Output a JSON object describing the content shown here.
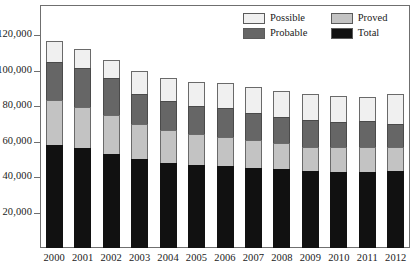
{
  "chart_data": {
    "type": "bar",
    "subtype": "stacked-column",
    "title": "",
    "xlabel": "",
    "ylabel": "",
    "categories": [
      "2000",
      "2001",
      "2002",
      "2003",
      "2004",
      "2005",
      "2006",
      "2007",
      "2008",
      "2009",
      "2010",
      "2011",
      "2012"
    ],
    "series": [
      {
        "name": "Total",
        "color": "#111111",
        "values": [
          58000,
          56300,
          53000,
          50200,
          48000,
          47000,
          46300,
          45200,
          44300,
          43300,
          42700,
          42700,
          43400
        ]
      },
      {
        "name": "Proved",
        "color": "#c3c3c3",
        "values": [
          25500,
          23100,
          22000,
          19900,
          18700,
          17300,
          16400,
          15600,
          14800,
          13900,
          14000,
          14100,
          13600
        ]
      },
      {
        "name": "Probable",
        "color": "#666666",
        "values": [
          21500,
          22100,
          21000,
          17000,
          16200,
          16000,
          16100,
          15200,
          15000,
          15000,
          14400,
          14700,
          12700
        ]
      },
      {
        "name": "Possible",
        "color": "#f0f0f0",
        "values": [
          11500,
          10900,
          9800,
          12700,
          13000,
          13500,
          14100,
          14600,
          14600,
          14500,
          14400,
          13900,
          17300
        ]
      }
    ],
    "stack_order_bottom_to_top": [
      "Total",
      "Proved",
      "Probable",
      "Possible"
    ],
    "cumulative_totals": [
      116500,
      112400,
      105800,
      99800,
      95900,
      93800,
      92900,
      90600,
      88700,
      86700,
      85500,
      85400,
      87000
    ],
    "ylim": [
      0,
      137000
    ],
    "yticks": [
      20000,
      40000,
      60000,
      80000,
      100000,
      120000
    ],
    "ytick_labels": [
      "20,000",
      "40,000",
      "60,000",
      "80,000",
      "100,000",
      "120,000"
    ],
    "grid": false,
    "legend": {
      "position": "top-right",
      "entries": [
        {
          "label": "Possible",
          "color": "#f0f0f0"
        },
        {
          "label": "Proved",
          "color": "#c3c3c3"
        },
        {
          "label": "Probable",
          "color": "#666666"
        },
        {
          "label": "Total",
          "color": "#111111"
        }
      ]
    },
    "axis_color": "#6f6f6f",
    "text_color": "#1a1a1a"
  }
}
